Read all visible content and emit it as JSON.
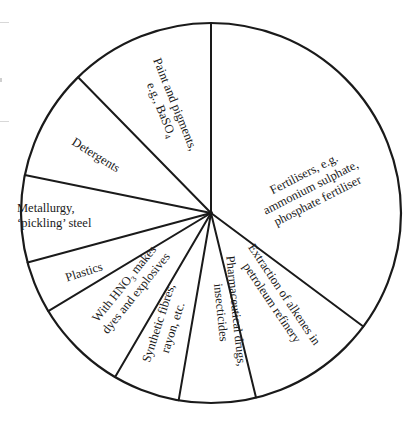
{
  "chart_data": {
    "type": "pie",
    "title": "",
    "start_angle_deg": 0,
    "direction": "clockwise",
    "center": [
      211,
      213
    ],
    "radius": 190,
    "slice_fill": "#ffffff",
    "stroke_color": "#1a1a1a",
    "slices": [
      {
        "label": "Fertilisers, e.g. ammonium sulphate, phosphate fertiliser",
        "lines": [
          "Fertilisers, e.g.",
          "ammonium sulphate,",
          "phosphate fertiliser"
        ],
        "value": 35.2,
        "start_deg": 0,
        "end_deg": 126.7
      },
      {
        "label": "Extraction of alkenes in petroleum refinery",
        "lines": [
          "Extraction of alkenes in",
          "petroleum refinery"
        ],
        "value": 11.0,
        "start_deg": 126.7,
        "end_deg": 166.3
      },
      {
        "label": "Pharmaceutical drugs, insecticides",
        "lines": [
          "Pharmaceutical drugs,",
          "insecticides"
        ],
        "value": 6.5,
        "start_deg": 166.3,
        "end_deg": 189.8
      },
      {
        "label": "Synthetic fibres, rayon, etc.",
        "lines": [
          "Synthetic fibres,",
          "rayon, etc."
        ],
        "value": 5.7,
        "start_deg": 189.8,
        "end_deg": 210.3
      },
      {
        "label": "With HNO3 makes dyes and explosives",
        "lines": [
          "With HNO",
          "3",
          " makes",
          "dyes and explosives"
        ],
        "value": 7.9,
        "start_deg": 210.3,
        "end_deg": 238.9
      },
      {
        "label": "Plastics",
        "lines": [
          "Plastics"
        ],
        "value": 4.4,
        "start_deg": 238.9,
        "end_deg": 254.9
      },
      {
        "label": "Metallurgy, 'pickling' steel",
        "lines": [
          "Metallurgy,",
          "‘pickling’ steel"
        ],
        "value": 7.4,
        "start_deg": 254.9,
        "end_deg": 281.5
      },
      {
        "label": "Detergents",
        "lines": [
          "Detergents"
        ],
        "value": 9.5,
        "start_deg": 281.5,
        "end_deg": 315.6
      },
      {
        "label": "Paint and pigments, e.g., BaSO4",
        "lines": [
          "Paint and pigments,",
          "e.g., BaSO",
          "4"
        ],
        "value": 12.3,
        "start_deg": 315.6,
        "end_deg": 360
      }
    ],
    "legend": "none (labels inside slices)",
    "grid": false
  }
}
